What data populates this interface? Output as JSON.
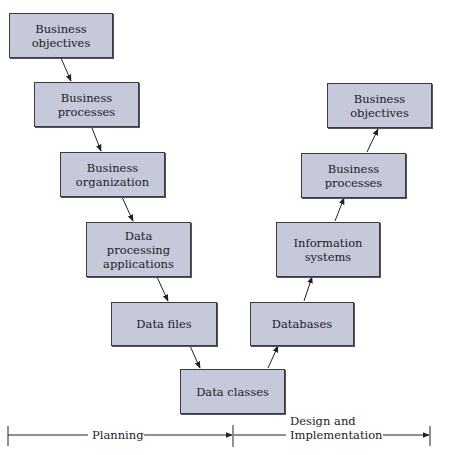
{
  "diagram": {
    "type": "V-model flow",
    "colors": {
      "box_fill": "#c5c9da",
      "box_border": "#3a3a44",
      "line": "#222222"
    },
    "planning_side": [
      {
        "id": "bo_l",
        "label": "Business objectives"
      },
      {
        "id": "bp_l",
        "label": "Business processes"
      },
      {
        "id": "borg",
        "label": "Business organization"
      },
      {
        "id": "dpa",
        "label": "Data processing applications"
      },
      {
        "id": "df",
        "label": "Data files"
      }
    ],
    "bottom": {
      "id": "dc",
      "label": "Data classes"
    },
    "implementation_side": [
      {
        "id": "db",
        "label": "Databases"
      },
      {
        "id": "is",
        "label": "Information systems"
      },
      {
        "id": "bp_r",
        "label": "Business processes"
      },
      {
        "id": "bo_r",
        "label": "Business objectives"
      }
    ],
    "edges": [
      [
        "bo_l",
        "bp_l"
      ],
      [
        "bp_l",
        "borg"
      ],
      [
        "borg",
        "dpa"
      ],
      [
        "dpa",
        "df"
      ],
      [
        "df",
        "dc"
      ],
      [
        "dc",
        "db"
      ],
      [
        "db",
        "is"
      ],
      [
        "is",
        "bp_r"
      ],
      [
        "bp_r",
        "bo_r"
      ]
    ],
    "timeline": {
      "phases": [
        {
          "label": "Planning"
        },
        {
          "label_line1": "Design and",
          "label_line2": "Implementation"
        }
      ]
    }
  }
}
